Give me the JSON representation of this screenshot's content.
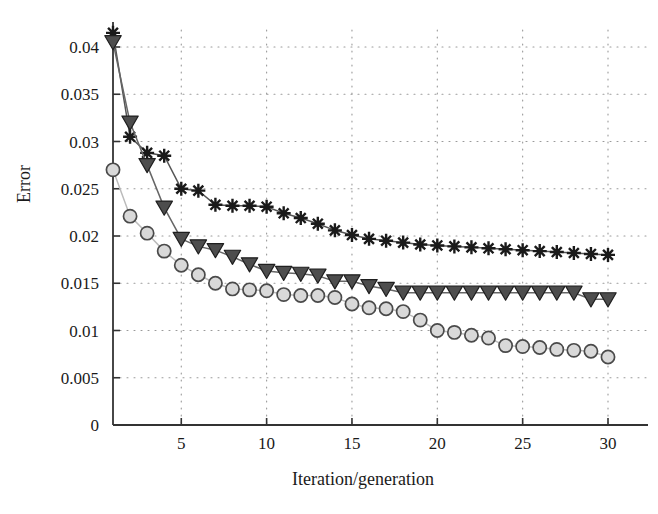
{
  "chart_data": {
    "type": "line",
    "title": "",
    "subtitle": "",
    "xlabel": "Iteration/generation",
    "ylabel": "Error",
    "xlim": [
      1,
      30
    ],
    "ylim": [
      0,
      0.0425
    ],
    "grid": true,
    "grid_style": "dotted",
    "legend_position": "none",
    "x_ticks": [
      5,
      10,
      15,
      20,
      25,
      30
    ],
    "x_tick_labels": [
      "5",
      "10",
      "15",
      "20",
      "25",
      "30"
    ],
    "y_ticks": [
      0,
      0.005,
      0.01,
      0.015,
      0.02,
      0.025,
      0.03,
      0.035,
      0.04
    ],
    "y_tick_labels": [
      "0",
      "0.005",
      "0.01",
      "0.015",
      "0.02",
      "0.025",
      "0.03",
      "0.035",
      "0.04"
    ],
    "x": [
      1,
      2,
      3,
      4,
      5,
      6,
      7,
      8,
      9,
      10,
      11,
      12,
      13,
      14,
      15,
      16,
      17,
      18,
      19,
      20,
      21,
      22,
      23,
      24,
      25,
      26,
      27,
      28,
      29,
      30
    ],
    "series": [
      {
        "name": "asterisk-series",
        "marker": "asterisk",
        "color": "#1a1a1a",
        "line_color": "#555555",
        "values": [
          0.0415,
          0.0305,
          0.0288,
          0.0285,
          0.025,
          0.0248,
          0.0233,
          0.0232,
          0.0232,
          0.0231,
          0.0224,
          0.0219,
          0.0213,
          0.0206,
          0.0201,
          0.0197,
          0.0195,
          0.0193,
          0.0191,
          0.019,
          0.0189,
          0.0188,
          0.0187,
          0.0186,
          0.0185,
          0.0184,
          0.0183,
          0.0182,
          0.0181,
          0.018
        ]
      },
      {
        "name": "triangle-series",
        "marker": "triangle-down",
        "color": "#4d4d4d",
        "line_color": "#666666",
        "values": [
          0.0405,
          0.032,
          0.0275,
          0.023,
          0.0197,
          0.0189,
          0.0185,
          0.0178,
          0.017,
          0.0163,
          0.0161,
          0.016,
          0.0158,
          0.0152,
          0.0152,
          0.0147,
          0.0144,
          0.014,
          0.014,
          0.014,
          0.014,
          0.014,
          0.014,
          0.014,
          0.014,
          0.014,
          0.014,
          0.014,
          0.0133,
          0.0133
        ]
      },
      {
        "name": "circle-series",
        "marker": "circle",
        "color": "#d9d9d9",
        "line_color": "#bbbbbb",
        "values": [
          0.027,
          0.0221,
          0.0203,
          0.0184,
          0.0169,
          0.0159,
          0.015,
          0.0144,
          0.0143,
          0.0142,
          0.0138,
          0.0137,
          0.0137,
          0.0135,
          0.0128,
          0.0124,
          0.0123,
          0.012,
          0.0111,
          0.01,
          0.0098,
          0.0095,
          0.0092,
          0.0084,
          0.0083,
          0.0082,
          0.008,
          0.0079,
          0.0078,
          0.0072
        ]
      }
    ]
  },
  "axes": {
    "axis_color": "#333333",
    "grid_color": "#9a9a9a",
    "background": "#ffffff"
  }
}
